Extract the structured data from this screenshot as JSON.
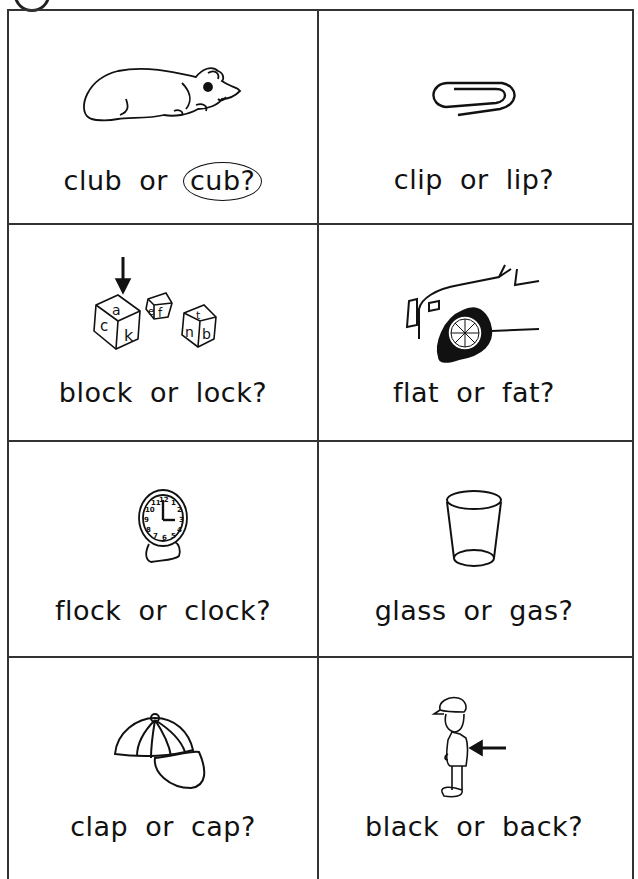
{
  "worksheet": {
    "items": [
      {
        "picture": "bear-cub",
        "option_a": "club",
        "connector": "or",
        "option_b": "cub?",
        "circled": "cub?"
      },
      {
        "picture": "paper-clip",
        "option_a": "clip",
        "connector": "or",
        "option_b": "lip?",
        "circled": null
      },
      {
        "picture": "letter-blocks",
        "option_a": "block",
        "connector": "or",
        "option_b": "lock?",
        "circled": null
      },
      {
        "picture": "flat-tire-car",
        "option_a": "flat",
        "connector": "or",
        "option_b": "fat?",
        "circled": null
      },
      {
        "picture": "alarm-clock",
        "option_a": "flock",
        "connector": "or",
        "option_b": "clock?",
        "circled": null
      },
      {
        "picture": "drinking-glass",
        "option_a": "glass",
        "connector": "or",
        "option_b": "gas?",
        "circled": null
      },
      {
        "picture": "baseball-cap",
        "option_a": "clap",
        "connector": "or",
        "option_b": "cap?",
        "circled": null
      },
      {
        "picture": "boy-back-arrow",
        "option_a": "black",
        "connector": "or",
        "option_b": "back?",
        "circled": null
      }
    ],
    "block_letters": {
      "block1": [
        "a",
        "c",
        "k"
      ],
      "block2": [
        "i",
        "e",
        "f"
      ],
      "block3": [
        "t",
        "n",
        "b"
      ]
    },
    "clock_numbers": [
      "12",
      "1",
      "2",
      "3",
      "4",
      "5",
      "6",
      "7",
      "8",
      "9",
      "10",
      "11"
    ],
    "colors": {
      "ink": "#111111",
      "grid": "#333333",
      "paper": "#ffffff"
    }
  }
}
